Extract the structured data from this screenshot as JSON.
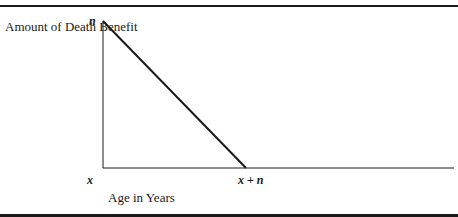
{
  "chart_data": {
    "type": "line",
    "title": "",
    "ylabel": "Amount of Death Benefit",
    "xlabel": "Age in Years",
    "x_tick_labels": [
      "x",
      "x + n"
    ],
    "y_tick_labels": [
      "n"
    ],
    "x_domain": [
      0,
      2
    ],
    "y_domain": [
      0,
      1
    ],
    "series": [
      {
        "name": "Death Benefit",
        "points": [
          {
            "x": 0,
            "y": 1
          },
          {
            "x": 1,
            "y": 0
          }
        ]
      }
    ],
    "grid": false,
    "legend": "none"
  }
}
